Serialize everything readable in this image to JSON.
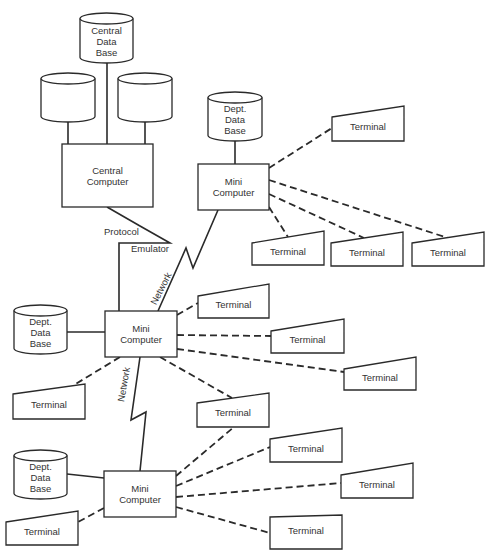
{
  "diagram": {
    "type": "distributed-network-architecture",
    "colors": {
      "line": "#2a2a2a",
      "text": "#333333",
      "background": "#ffffff"
    },
    "databases": [
      {
        "id": "central-db",
        "lines": [
          "Central",
          "Data",
          "Base"
        ],
        "x": 80,
        "y": 13,
        "w": 53,
        "h": 50
      },
      {
        "id": "storage-left",
        "lines": [],
        "x": 41,
        "y": 73,
        "w": 54,
        "h": 49
      },
      {
        "id": "storage-right",
        "lines": [],
        "x": 118,
        "y": 73,
        "w": 54,
        "h": 49
      },
      {
        "id": "dept-db-top",
        "lines": [
          "Dept.",
          "Data",
          "Base"
        ],
        "x": 208,
        "y": 92,
        "w": 54,
        "h": 49
      },
      {
        "id": "dept-db-middle",
        "lines": [
          "Dept.",
          "Data",
          "Base"
        ],
        "x": 14,
        "y": 305,
        "w": 53,
        "h": 49
      },
      {
        "id": "dept-db-bottom",
        "lines": [
          "Dept.",
          "Data",
          "Base"
        ],
        "x": 14,
        "y": 450,
        "w": 53,
        "h": 49
      }
    ],
    "computers": [
      {
        "id": "central-computer",
        "lines": [
          "Central",
          "Computer"
        ],
        "x": 62,
        "y": 144,
        "w": 91,
        "h": 63
      },
      {
        "id": "mini-computer-top",
        "lines": [
          "Mini",
          "Computer"
        ],
        "x": 198,
        "y": 164,
        "w": 71,
        "h": 46
      },
      {
        "id": "mini-computer-middle",
        "lines": [
          "Mini",
          "Computer"
        ],
        "x": 105,
        "y": 311,
        "w": 72,
        "h": 46
      },
      {
        "id": "mini-computer-bottom",
        "lines": [
          "Mini",
          "Computer"
        ],
        "x": 104,
        "y": 471,
        "w": 72,
        "h": 46
      }
    ],
    "terminals": [
      {
        "id": "t1",
        "label": "Terminal",
        "x": 332,
        "ytl": 117,
        "ytr": 106,
        "w": 72,
        "yb": 141,
        "owner": "mini-computer-top"
      },
      {
        "id": "t2",
        "label": "Terminal",
        "x": 252,
        "ytl": 243,
        "ytr": 231,
        "w": 72,
        "yb": 265,
        "owner": "mini-computer-top"
      },
      {
        "id": "t3",
        "label": "Terminal",
        "x": 331,
        "ytl": 243,
        "ytr": 232,
        "w": 72,
        "yb": 266,
        "owner": "mini-computer-top"
      },
      {
        "id": "t4",
        "label": "Terminal",
        "x": 412,
        "ytl": 243,
        "ytr": 232,
        "w": 72,
        "yb": 266,
        "owner": "mini-computer-top"
      },
      {
        "id": "t5",
        "label": "Terminal",
        "x": 198,
        "ytl": 296,
        "ytr": 284,
        "w": 71,
        "yb": 318,
        "owner": "mini-computer-middle"
      },
      {
        "id": "t6",
        "label": "Terminal",
        "x": 271,
        "ytl": 331,
        "ytr": 319,
        "w": 73,
        "yb": 353,
        "owner": "mini-computer-middle"
      },
      {
        "id": "t7",
        "label": "Terminal",
        "x": 344,
        "ytl": 369,
        "ytr": 357,
        "w": 72,
        "yb": 390,
        "owner": "mini-computer-middle"
      },
      {
        "id": "t8",
        "label": "Terminal",
        "x": 13,
        "ytl": 394,
        "ytr": 384,
        "w": 72,
        "yb": 419,
        "owner": "mini-computer-middle"
      },
      {
        "id": "t9",
        "label": "Terminal",
        "x": 197,
        "ytl": 403,
        "ytr": 393,
        "w": 72,
        "yb": 427,
        "owner": "mini-computer-middle"
      },
      {
        "id": "t10",
        "label": "Terminal",
        "x": 270,
        "ytl": 439,
        "ytr": 428,
        "w": 72,
        "yb": 462,
        "owner": "mini-computer-bottom"
      },
      {
        "id": "t11",
        "label": "Terminal",
        "x": 341,
        "ytl": 475,
        "ytr": 463,
        "w": 72,
        "yb": 498,
        "owner": "mini-computer-bottom"
      },
      {
        "id": "t12",
        "label": "Terminal",
        "x": 270,
        "ytl": 517,
        "ytr": 515,
        "w": 72,
        "yb": 549,
        "owner": "mini-computer-bottom"
      },
      {
        "id": "t13",
        "label": "Terminal",
        "x": 6,
        "ytl": 522,
        "ytr": 511,
        "w": 72,
        "yb": 545,
        "owner": "mini-computer-bottom"
      }
    ],
    "labels": {
      "protocol": "Protocol",
      "emulator": "Emulator",
      "network_upper": "Network",
      "network_lower": "Network"
    }
  }
}
